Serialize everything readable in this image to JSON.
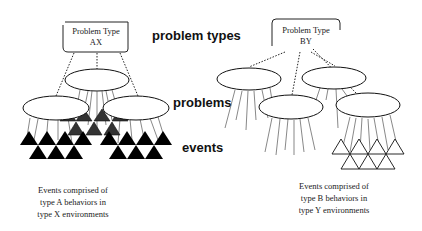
{
  "labels": {
    "problem_types": "problem types",
    "problems": "problems",
    "events": "events"
  },
  "left": {
    "box_line1": "Problem Type",
    "box_line2": "AX",
    "caption": [
      "Events comprised of",
      "type A behaviors in",
      "type X environments"
    ],
    "triangle_style": "filled black"
  },
  "right": {
    "box_line1": "Problem Type",
    "box_line2": "BY",
    "caption": [
      "Events comprised of",
      "type B behaviors in",
      "type Y environments"
    ],
    "triangle_style": "outlined"
  },
  "colors": {
    "ink": "#111111",
    "background": "#ffffff"
  }
}
